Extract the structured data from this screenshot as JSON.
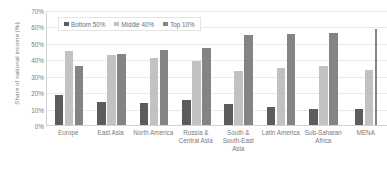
{
  "chart_data": {
    "type": "bar",
    "title": "",
    "subtitle": "",
    "xlabel": "",
    "ylabel": "Share of national income (%)",
    "ylim": [
      0,
      70
    ],
    "y_ticks": [
      "0%",
      "10%",
      "20%",
      "30%",
      "40%",
      "50%",
      "60%",
      "70%"
    ],
    "y_tick_values": [
      0,
      10,
      20,
      30,
      40,
      50,
      60,
      70
    ],
    "grid": true,
    "legend_position": "top-left-inside",
    "categories": [
      "Europe",
      "East Asia",
      "North America",
      "Russia & Central Asia",
      "South & South-East Asia",
      "Latin America",
      "Sub-Saharan Africa",
      "MENA"
    ],
    "series": [
      {
        "name": "Bottom 50%",
        "color": "#5c5c5c",
        "values": [
          18.5,
          14.0,
          13.5,
          15.0,
          12.8,
          10.8,
          9.6,
          10.0
        ]
      },
      {
        "name": "Middle 40%",
        "color": "#c2c2c2",
        "values": [
          45.0,
          42.5,
          41.0,
          38.8,
          33.0,
          35.0,
          36.0,
          33.5
        ]
      },
      {
        "name": "Top 10%",
        "color": "#848484",
        "values": [
          36.0,
          43.5,
          45.5,
          47.0,
          55.0,
          55.5,
          56.0,
          58.5
        ]
      }
    ],
    "notes": {
      "last_group_top_bar_clipped": true
    }
  },
  "colors": {
    "background": "#ffffff",
    "axis": "#d2d2d2",
    "gridline": "#e9e9e9",
    "text": "#7a7a7a",
    "series_bottom_50": "#5c5c5c",
    "series_middle_40": "#c2c2c2",
    "series_top_10": "#848484"
  }
}
